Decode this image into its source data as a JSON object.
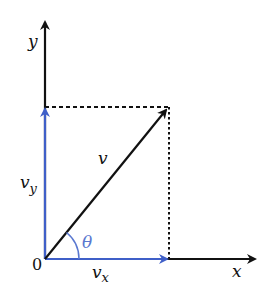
{
  "diagram": {
    "colors": {
      "axis": "#111111",
      "component": "#3f5fc8",
      "angle": "#5a78d0"
    },
    "labels": {
      "y_axis": "y",
      "x_axis": "x",
      "origin": "0",
      "vector": "v",
      "vy_main": "v",
      "vy_sub": "y",
      "vx_main": "v",
      "vx_sub": "x",
      "angle": "θ"
    }
  }
}
